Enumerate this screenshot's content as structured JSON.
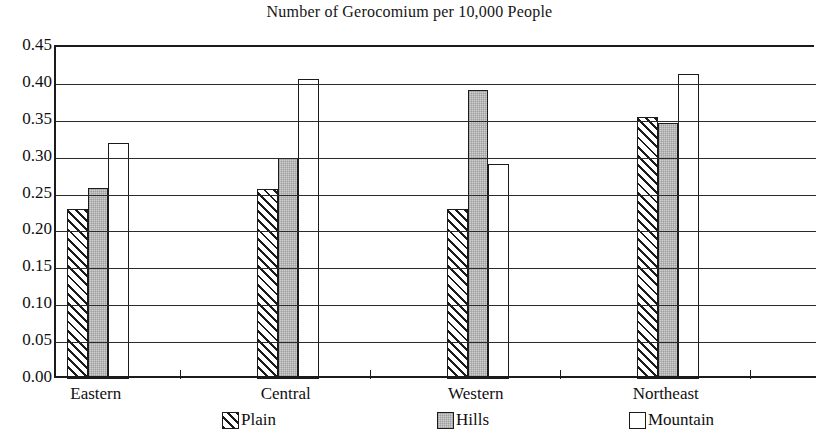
{
  "chart_data": {
    "type": "bar",
    "title": "Number of Gerocomium per 10,000 People",
    "xlabel": "",
    "ylabel": "",
    "categories": [
      "Eastern",
      "Central",
      "Western",
      "Northeast"
    ],
    "series": [
      {
        "name": "Plain",
        "values": [
          0.23,
          0.258,
          0.23,
          0.355
        ],
        "fill": "diagonal-hatch",
        "color": "#ffffff"
      },
      {
        "name": "Hills",
        "values": [
          0.259,
          0.3,
          0.392,
          0.347
        ],
        "fill": "light-gray",
        "color": "#cfcfcf"
      },
      {
        "name": "Mountain",
        "values": [
          0.32,
          0.407,
          0.291,
          0.413
        ],
        "fill": "white",
        "color": "#ffffff"
      }
    ],
    "ylim": [
      0.0,
      0.45
    ],
    "ytick_labels": [
      "0.45",
      "0.40",
      "0.35",
      "0.30",
      "0.25",
      "0.20",
      "0.15",
      "0.10",
      "0.05",
      "0.00"
    ],
    "ytick_values": [
      0.45,
      0.4,
      0.35,
      0.3,
      0.25,
      0.2,
      0.15,
      0.1,
      0.05,
      0.0
    ],
    "grid": true,
    "legend_position": "bottom",
    "legend_entries": [
      "Plain",
      "Hills",
      "Mountain"
    ]
  }
}
